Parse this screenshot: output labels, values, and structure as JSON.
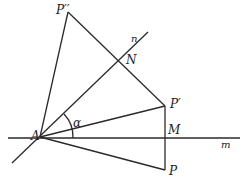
{
  "diagram": {
    "type": "geometry-reflection",
    "labels": {
      "A": "A",
      "P": "P",
      "P1": "P′",
      "P2": "P′′",
      "M": "M",
      "N": "N",
      "m": "m",
      "n": "n",
      "alpha": "α"
    },
    "points": {
      "A": [
        40,
        137
      ],
      "P": [
        165,
        170
      ],
      "P1": [
        165,
        106
      ],
      "P2": [
        68,
        12
      ],
      "M": [
        165,
        138
      ],
      "N": [
        143,
        60
      ]
    },
    "lines": {
      "m": {
        "from": [
          8,
          138
        ],
        "to": [
          240,
          138
        ]
      },
      "n": {
        "from": [
          12,
          163
        ],
        "to": [
          148,
          32
        ]
      }
    },
    "stroke_color": "#2a2a2a"
  }
}
